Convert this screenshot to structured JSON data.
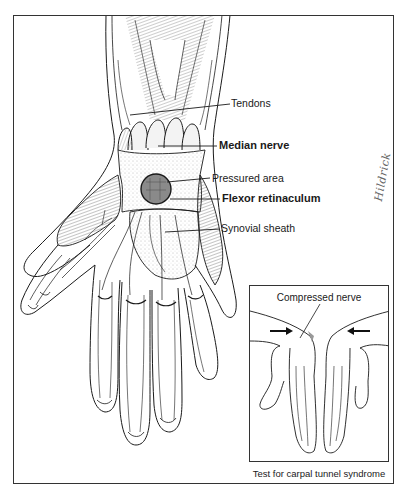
{
  "figure": {
    "type": "anatomical illustration",
    "view": "palmar view of right hand and wrist",
    "labels": [
      {
        "id": "tendons",
        "text": "Tendons",
        "bold": false
      },
      {
        "id": "median-nerve",
        "text": "Median nerve",
        "bold": true
      },
      {
        "id": "pressured-area",
        "text": "Pressured area",
        "bold": false
      },
      {
        "id": "flexor-retinaculum",
        "text": "Flexor retinaculum",
        "bold": true
      },
      {
        "id": "synovial-sheath",
        "text": "Synovial sheath",
        "bold": false
      }
    ],
    "signature": "Hildrick"
  },
  "inset": {
    "title": "Compressed nerve",
    "caption": "Test for carpal tunnel syndrome",
    "arrows": [
      "right-pointing arrow",
      "left-pointing arrow"
    ]
  },
  "colors": {
    "line": "#1a1a1a",
    "background": "#ffffff",
    "shading": "#9a9a9a",
    "pressure_circle": "#7a7a7a"
  }
}
